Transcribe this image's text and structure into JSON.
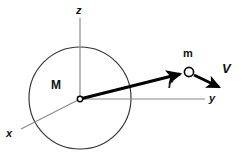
{
  "figure": {
    "background_color": "#ffffff",
    "width": 242,
    "height": 158,
    "colors": {
      "axis_gray": "#8a8a8a",
      "circle_stroke": "#333333",
      "vector_black": "#000000",
      "label_color": "#111111"
    },
    "labels": {
      "axis_z": "z",
      "axis_y": "y",
      "axis_x": "x",
      "central_body": "M",
      "orbiting_body": "m",
      "position_vector": "r",
      "velocity_vector": "V"
    },
    "geometry": {
      "origin": {
        "x": 80,
        "y": 99
      },
      "circle": {
        "cx": 80,
        "cy": 98,
        "r": 51
      },
      "z_axis": {
        "x1": 80,
        "y1": 18,
        "x2": 80,
        "y2": 99
      },
      "y_axis": {
        "x1": 80,
        "y1": 99,
        "x2": 205,
        "y2": 99
      },
      "x_axis": {
        "x1": 80,
        "y1": 99,
        "x2": 22,
        "y2": 128
      },
      "r_vector": {
        "x1": 80,
        "y1": 99,
        "x2": 183,
        "y2": 73
      },
      "v_vector": {
        "x1": 195,
        "y1": 75,
        "x2": 222,
        "y2": 89
      },
      "mass_point": {
        "cx": 189,
        "cy": 72,
        "r": 5
      },
      "origin_point": {
        "cx": 80,
        "cy": 99,
        "r": 3
      }
    },
    "label_positions": {
      "axis_z": {
        "x": 76,
        "y": 6
      },
      "axis_y": {
        "x": 209,
        "y": 93
      },
      "axis_x": {
        "x": 7,
        "y": 128
      },
      "central_body": {
        "x": 52,
        "y": 79
      },
      "orbiting_body": {
        "x": 183,
        "y": 49
      },
      "position_vector": {
        "x": 168,
        "y": 79
      },
      "velocity_vector": {
        "x": 223,
        "y": 64
      }
    }
  }
}
